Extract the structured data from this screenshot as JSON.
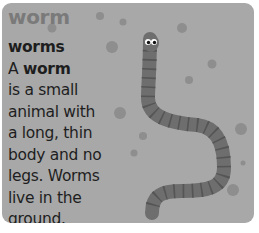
{
  "card": {
    "headword": "worm",
    "plural": "worms",
    "definition_lines": [
      {
        "pre": "A ",
        "bold": "worm",
        "post": ""
      },
      {
        "pre": "is a small",
        "bold": "",
        "post": ""
      },
      {
        "pre": "animal with",
        "bold": "",
        "post": ""
      },
      {
        "pre": "a long, thin",
        "bold": "",
        "post": ""
      },
      {
        "pre": "body and no",
        "bold": "",
        "post": ""
      },
      {
        "pre": "legs. Worms",
        "bold": "",
        "post": ""
      },
      {
        "pre": "live in the",
        "bold": "",
        "post": ""
      },
      {
        "pre": "ground.",
        "bold": "",
        "post": ""
      }
    ],
    "illustration": "worm-illustration",
    "colors": {
      "background": "#a8a8a8",
      "headword": "#7a7a7a",
      "text": "#1e1e1e",
      "worm_body": "#6e6e6e",
      "worm_stripes": "#555555",
      "dots": "#8c8c8c"
    }
  }
}
